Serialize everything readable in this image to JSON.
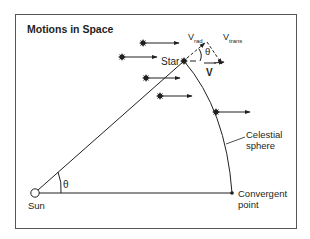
{
  "title": "Motions in Space",
  "labels": {
    "star": "Star",
    "sun": "Sun",
    "celestial_line1": "Celestial",
    "celestial_line2": "sphere",
    "convergent_line1": "Convergent",
    "convergent_line2": "point",
    "theta_sun": "θ",
    "theta_star": "θ",
    "v_rad_main": "V",
    "v_rad_sub": "rad",
    "v_trans_main": "V",
    "v_trans_sub": "trans",
    "v_total": "V"
  },
  "colors": {
    "stroke": "#231f20",
    "frame": "#555555",
    "background": "#ffffff"
  }
}
